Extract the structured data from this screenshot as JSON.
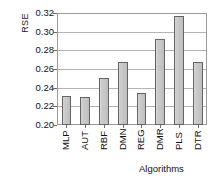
{
  "chart_data": {
    "type": "bar",
    "title": "",
    "xlabel": "Algorithms",
    "ylabel": "RSE",
    "categories": [
      "MLP",
      "AUT",
      "RBF",
      "DMN",
      "REG",
      "DMR",
      "PLS",
      "DTR"
    ],
    "values": [
      0.231,
      0.23,
      0.25,
      0.267,
      0.234,
      0.292,
      0.317,
      0.268
    ],
    "ylim": [
      0.2,
      0.32
    ],
    "ytick_step": 0.02,
    "yticks": [
      0.2,
      0.22,
      0.24,
      0.26,
      0.28,
      0.3,
      0.32
    ],
    "ytick_labels": [
      "0.20",
      "0.22",
      "0.24",
      "0.26",
      "0.28",
      "0.30",
      "0.32"
    ],
    "grid": true,
    "grid_axis": "y",
    "legend": false,
    "legend_position": "none",
    "bar_fill_color": "#c8c8c8",
    "bar_edge_color": "#646464",
    "plot_background": "#ffffff",
    "gridline_color": "#b4b4b4",
    "axis_color": "#9a9a9a",
    "text_color": "#111111",
    "xtick_label_rotation": 90
  }
}
